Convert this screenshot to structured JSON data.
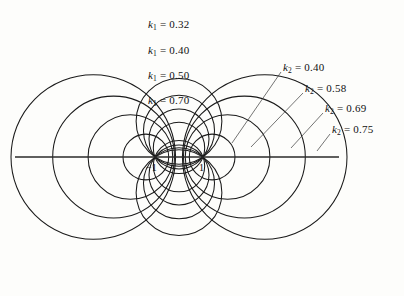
{
  "figure": {
    "background_color": "#fdfdfb",
    "stroke_color": "#1a1a1a",
    "axis_color": "#2a2a2a",
    "leader_color": "#3a3a3a"
  },
  "axis": {
    "name": "real-axis",
    "x_start": 15,
    "x_end": 339,
    "y": 157
  },
  "foci": [
    {
      "label": "−1",
      "value": -1,
      "px_x": 155,
      "px_y": 157,
      "label_x": 146,
      "label_y": 162
    },
    {
      "label": "1",
      "value": 1,
      "px_x": 203,
      "px_y": 157,
      "label_x": 199,
      "label_y": 162
    }
  ],
  "geometry": {
    "center_px_x": 179,
    "center_px_y": 157,
    "unit_px": 24
  },
  "k1_labels": [
    {
      "symbol": "k",
      "sub": "1",
      "eq": "=",
      "value": "0.32",
      "text": "k₁ = 0.32",
      "x": 148,
      "y": 19
    },
    {
      "symbol": "k",
      "sub": "1",
      "eq": "=",
      "value": "0.40",
      "text": "k₁ = 0.40",
      "x": 148,
      "y": 45
    },
    {
      "symbol": "k",
      "sub": "1",
      "eq": "=",
      "value": "0.50",
      "text": "k₁ = 0.50",
      "x": 148,
      "y": 70
    },
    {
      "symbol": "k",
      "sub": "1",
      "eq": "=",
      "value": "0.70",
      "text": "k₁ = 0.70",
      "x": 148,
      "y": 95
    }
  ],
  "k2_labels": [
    {
      "symbol": "k",
      "sub": "2",
      "eq": "=",
      "value": "0.40",
      "text": "k₂ = 0.40",
      "x": 283,
      "y": 62,
      "leader": {
        "x1": 281,
        "y1": 72,
        "x2": 232,
        "y2": 143
      }
    },
    {
      "symbol": "k",
      "sub": "2",
      "eq": "=",
      "value": "0.58",
      "text": "k₂ = 0.58",
      "x": 305,
      "y": 83,
      "leader": {
        "x1": 303,
        "y1": 93,
        "x2": 251,
        "y2": 147
      }
    },
    {
      "symbol": "k",
      "sub": "2",
      "eq": "=",
      "value": "0.69",
      "text": "k₂ = 0.69",
      "x": 325,
      "y": 103,
      "leader": {
        "x1": 323,
        "y1": 113,
        "x2": 291,
        "y2": 148
      }
    },
    {
      "symbol": "k",
      "sub": "2",
      "eq": "=",
      "value": "0.75",
      "text": "k₂ = 0.75",
      "x": 332,
      "y": 124,
      "leader": {
        "x1": 330,
        "y1": 134,
        "x2": 317,
        "y2": 151
      }
    }
  ],
  "chart_data": {
    "type": "line",
    "xlabel": "",
    "ylabel": "",
    "foci": [
      -1,
      1
    ],
    "xlim": [
      -7.0,
      7.0
    ],
    "ylim": [
      -5.2,
      5.2
    ],
    "grid": false,
    "legend_position": "inline-annotations",
    "series": [
      {
        "name": "k1 = 0.32",
        "family": "circles-through-foci",
        "k": 0.32,
        "center": [
          0,
          1.4846
        ],
        "radius": 1.7866,
        "mirrored_about_x_axis": true
      },
      {
        "name": "k1 = 0.40",
        "family": "circles-through-foci",
        "k": 0.4,
        "center": [
          0,
          1.0911
        ],
        "radius": 1.48,
        "mirrored_about_x_axis": true
      },
      {
        "name": "k1 = 0.50",
        "family": "circles-through-foci",
        "k": 0.5,
        "center": [
          0,
          0.75
        ],
        "radius": 1.25,
        "mirrored_about_x_axis": true
      },
      {
        "name": "k1 = 0.70",
        "family": "circles-through-foci",
        "k": 0.7,
        "center": [
          0,
          0.38
        ],
        "radius": 1.0698,
        "mirrored_about_x_axis": true
      },
      {
        "name": "k2 = 0.40",
        "family": "apollonius",
        "k": 0.4,
        "center": [
          1.381,
          0
        ],
        "radius": 0.9524,
        "mirrored_about_y_axis": true
      },
      {
        "name": "k2 = 0.58",
        "family": "apollonius",
        "k": 0.58,
        "center": [
          2.0243,
          0
        ],
        "radius": 1.7641,
        "mirrored_about_y_axis": true
      },
      {
        "name": "k2 = 0.69",
        "family": "apollonius",
        "k": 0.69,
        "center": [
          2.7248,
          0
        ],
        "radius": 2.5375,
        "mirrored_about_y_axis": true
      },
      {
        "name": "k2 = 0.75",
        "family": "apollonius",
        "k": 0.75,
        "center": [
          3.5714,
          0
        ],
        "radius": 3.4286,
        "mirrored_about_y_axis": true
      }
    ],
    "annotations": [
      {
        "text": "−1",
        "x": -1,
        "y": 0
      },
      {
        "text": "1",
        "x": 1,
        "y": 0
      }
    ]
  }
}
